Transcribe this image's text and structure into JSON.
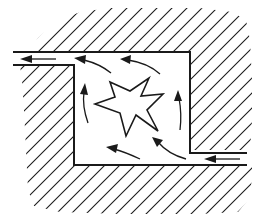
{
  "diagram": {
    "colors": {
      "ink": "#1a1a1a",
      "background": "#ffffff"
    },
    "elements": {
      "solid_regions": [
        "upper-wall-hatching",
        "lower-left-wall-hatching"
      ],
      "inlet": {
        "side": "right",
        "direction": "leftward"
      },
      "outlet": {
        "side": "left",
        "direction": "leftward"
      },
      "source": {
        "shape": "eight-point star",
        "position": "center of chamber"
      },
      "circulation": {
        "sense": "counter-clockwise",
        "arrow_count": 6
      }
    }
  }
}
